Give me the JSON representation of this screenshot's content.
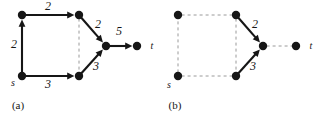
{
  "figure": {
    "background": "#ffffff",
    "ink": "#161616",
    "dash_color": "#9a9a9a",
    "node_radius": 4.2,
    "panels": [
      {
        "id": "a",
        "caption": "(a)",
        "caption_pos": {
          "x": 18,
          "y": 105
        },
        "nodes": [
          {
            "id": "a-top-left",
            "x": 22,
            "y": 15,
            "label": ""
          },
          {
            "id": "a-bottom-left",
            "x": 22,
            "y": 76,
            "label": "s",
            "label_pos": {
              "x": 13,
              "y": 83
            }
          },
          {
            "id": "a-top-mid",
            "x": 79,
            "y": 15,
            "label": ""
          },
          {
            "id": "a-bottom-mid",
            "x": 79,
            "y": 76,
            "label": ""
          },
          {
            "id": "a-center",
            "x": 106,
            "y": 46,
            "label": ""
          },
          {
            "id": "a-sink",
            "x": 137,
            "y": 46,
            "label": "t",
            "label_pos": {
              "x": 152,
              "y": 46
            }
          }
        ],
        "edges": [
          {
            "id": "a-e1",
            "from": "a-bottom-left",
            "to": "a-top-left",
            "style": "solid",
            "arrow": true,
            "weight": "2",
            "weight_pos": {
              "x": 14,
              "y": 44
            }
          },
          {
            "id": "a-e2",
            "from": "a-top-left",
            "to": "a-top-mid",
            "style": "solid",
            "arrow": true,
            "weight": "2",
            "weight_pos": {
              "x": 48,
              "y": 6
            }
          },
          {
            "id": "a-e3",
            "from": "a-bottom-left",
            "to": "a-bottom-mid",
            "style": "solid",
            "arrow": true,
            "weight": "3",
            "weight_pos": {
              "x": 48,
              "y": 84
            }
          },
          {
            "id": "a-e4",
            "from": "a-top-mid",
            "to": "a-center",
            "style": "solid",
            "arrow": true,
            "weight": "2",
            "weight_pos": {
              "x": 98,
              "y": 24
            }
          },
          {
            "id": "a-e5",
            "from": "a-bottom-mid",
            "to": "a-center",
            "style": "solid",
            "arrow": true,
            "weight": "3",
            "weight_pos": {
              "x": 96,
              "y": 66
            }
          },
          {
            "id": "a-e6",
            "from": "a-center",
            "to": "a-sink",
            "style": "solid",
            "arrow": true,
            "weight": "5",
            "weight_pos": {
              "x": 119,
              "y": 31
            }
          },
          {
            "id": "a-cut",
            "from": "a-top-mid",
            "to": "a-bottom-mid",
            "style": "dashed",
            "arrow": false,
            "weight": ""
          }
        ]
      },
      {
        "id": "b",
        "caption": "(b)",
        "caption_pos": {
          "x": 175,
          "y": 105
        },
        "nodes": [
          {
            "id": "b-top-left",
            "x": 178,
            "y": 15,
            "label": ""
          },
          {
            "id": "b-bottom-left",
            "x": 178,
            "y": 76,
            "label": "s",
            "label_pos": {
              "x": 169,
              "y": 85
            }
          },
          {
            "id": "b-top-mid",
            "x": 236,
            "y": 15,
            "label": ""
          },
          {
            "id": "b-bottom-mid",
            "x": 236,
            "y": 76,
            "label": ""
          },
          {
            "id": "b-center",
            "x": 263,
            "y": 46,
            "label": ""
          },
          {
            "id": "b-sink",
            "x": 296,
            "y": 46,
            "label": "t",
            "label_pos": {
              "x": 311,
              "y": 46
            }
          }
        ],
        "edges": [
          {
            "id": "b-e1",
            "from": "b-bottom-left",
            "to": "b-top-left",
            "style": "dashed",
            "arrow": false,
            "weight": ""
          },
          {
            "id": "b-e2",
            "from": "b-top-left",
            "to": "b-top-mid",
            "style": "dashed",
            "arrow": false,
            "weight": ""
          },
          {
            "id": "b-e3",
            "from": "b-bottom-left",
            "to": "b-bottom-mid",
            "style": "dashed",
            "arrow": false,
            "weight": ""
          },
          {
            "id": "b-e4",
            "from": "b-top-mid",
            "to": "b-center",
            "style": "solid",
            "arrow": true,
            "weight": "2",
            "weight_pos": {
              "x": 255,
              "y": 24
            }
          },
          {
            "id": "b-e5",
            "from": "b-bottom-mid",
            "to": "b-center",
            "style": "solid",
            "arrow": true,
            "weight": "3",
            "weight_pos": {
              "x": 253,
              "y": 66
            }
          },
          {
            "id": "b-e6",
            "from": "b-center",
            "to": "b-sink",
            "style": "dashed",
            "arrow": false,
            "weight": ""
          },
          {
            "id": "b-cut",
            "from": "b-top-mid",
            "to": "b-bottom-mid",
            "style": "dashed",
            "arrow": false,
            "weight": ""
          }
        ]
      }
    ]
  }
}
